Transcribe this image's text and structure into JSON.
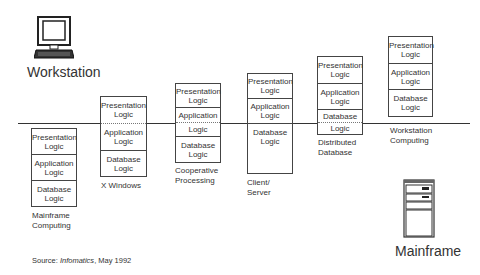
{
  "title_labels": {
    "workstation": "Workstation",
    "mainframe": "Mainframe"
  },
  "source": {
    "prefix": "Source: ",
    "publication": "Infomatics",
    "date": ", May 1992"
  },
  "icons": {
    "workstation": "computer-monitor-icon",
    "mainframe": "server-tower-icon"
  },
  "models": [
    {
      "name_l1": "Mainframe",
      "name_l2": "Computing",
      "layers": [
        [
          "Presentation",
          "Logic"
        ],
        [
          "Application",
          "Logic"
        ],
        [
          "Database",
          "Logic"
        ]
      ]
    },
    {
      "name_l1": "X Windows",
      "name_l2": "",
      "layers": [
        [
          "Presentation",
          "Logic"
        ],
        [
          "Application",
          "Logic"
        ],
        [
          "Database",
          "Logic"
        ]
      ]
    },
    {
      "name_l1": "Cooperative",
      "name_l2": "Processing",
      "layers": [
        [
          "Presentation",
          "Logic"
        ],
        [
          "Application",
          ""
        ],
        [
          "",
          "Logic"
        ],
        [
          "Database",
          "Logic"
        ]
      ]
    },
    {
      "name_l1": "Client/",
      "name_l2": "Server",
      "layers": [
        [
          "Presentation",
          "Logic"
        ],
        [
          "Application",
          "Logic"
        ],
        [
          "Database",
          "Logic"
        ]
      ]
    },
    {
      "name_l1": "Distributed",
      "name_l2": "Database",
      "layers": [
        [
          "Presentation",
          "Logic"
        ],
        [
          "Application",
          "Logic"
        ],
        [
          "Database",
          ""
        ],
        [
          "",
          "Logic"
        ]
      ]
    },
    {
      "name_l1": "Workstation",
      "name_l2": "Computing",
      "layers": [
        [
          "Presentation",
          "Logic"
        ],
        [
          "Application",
          "Logic"
        ],
        [
          "Database",
          "Logic"
        ]
      ]
    }
  ]
}
